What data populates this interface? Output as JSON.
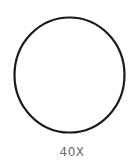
{
  "shape": {
    "icon": "circle-outline-icon",
    "stroke_color": "#1a1a1a",
    "fill_color": "#ffffff"
  },
  "label": {
    "text": "40X",
    "color": "#6b6b6b"
  }
}
